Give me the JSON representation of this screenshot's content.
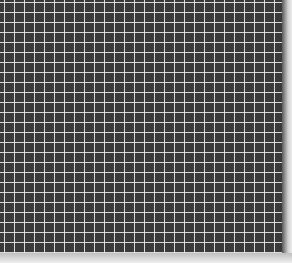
{
  "image": {
    "subject": "Photograph of a dark grid with thin white lines",
    "colors": {
      "background": "#3a3a3a",
      "grid_lines": "#ebebeb",
      "border": "#e6e6e6"
    },
    "grid_cell_size_px": 10
  }
}
